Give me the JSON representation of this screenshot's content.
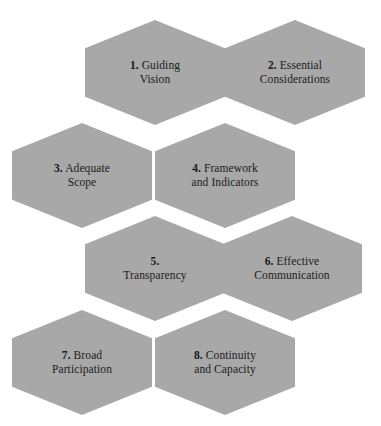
{
  "figure": {
    "type": "honeycomb-hexagon-diagram",
    "hex_fill_color": "#a8a8a8",
    "text_color": "#1a1a1a",
    "background_color": "#ffffff",
    "caption": ""
  },
  "hexagons": [
    {
      "number": "1.",
      "line1": "Guiding",
      "line2": "Vision",
      "name": "guiding-vision"
    },
    {
      "number": "2.",
      "line1": "Essential",
      "line2": "Considerations",
      "name": "essential-considerations"
    },
    {
      "number": "3.",
      "line1": "Adequate",
      "line2": "Scope",
      "name": "adequate-scope"
    },
    {
      "number": "4.",
      "line1": "Framework",
      "line2": "and Indicators",
      "name": "framework-and-indicators"
    },
    {
      "number": "5.",
      "line1": "",
      "line2": "Transparency",
      "name": "transparency"
    },
    {
      "number": "6.",
      "line1": "Effective",
      "line2": "Communication",
      "name": "effective-communication"
    },
    {
      "number": "7.",
      "line1": "Broad",
      "line2": "Participation",
      "name": "broad-participation"
    },
    {
      "number": "8.",
      "line1": "Continuity",
      "line2": "and Capacity",
      "name": "continuity-and-capacity"
    }
  ]
}
